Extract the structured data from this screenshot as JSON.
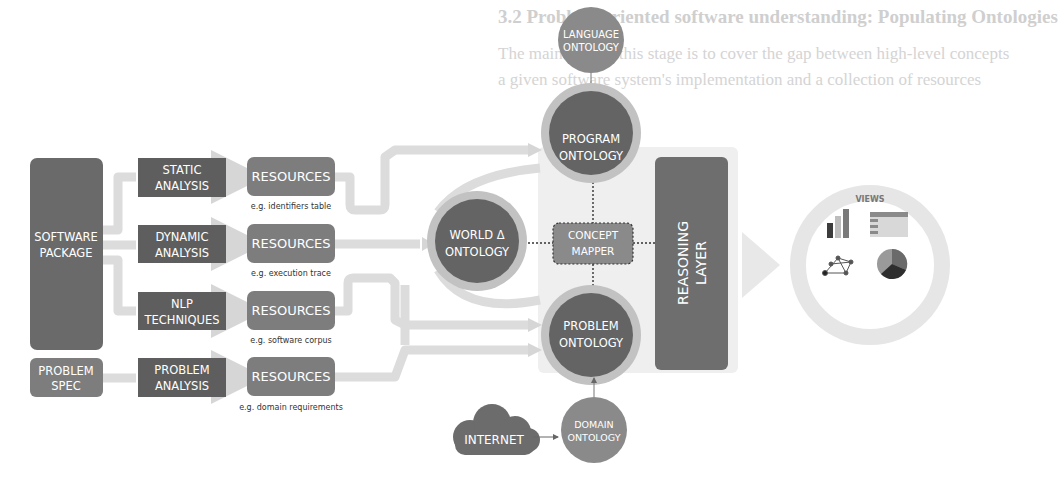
{
  "page": {
    "heading": "3.2  Problem-oriented software understanding: Populating Ontologies",
    "paragraph_lines": [
      "The main goal of this stage is to cover the gap between high-level concepts",
      "a given software system's implementation and a collection of resources",
      "and the output is ...",
      "...",
      "... important ...",
      "... a RDF-based triple store"
    ]
  },
  "diagram": {
    "sources": {
      "software_package": "SOFTWARE PACKAGE",
      "problem_spec": "PROBLEM SPEC"
    },
    "analyses": [
      {
        "label": "STATIC ANALYSIS",
        "line1": "STATIC",
        "line2": "ANALYSIS"
      },
      {
        "label": "DYNAMIC ANALYSIS",
        "line1": "DYNAMIC",
        "line2": "ANALYSIS"
      },
      {
        "label": "NLP TECHNIQUES",
        "line1": "NLP",
        "line2": "TECHNIQUES"
      },
      {
        "label": "PROBLEM ANALYSIS",
        "line1": "PROBLEM",
        "line2": "ANALYSIS"
      }
    ],
    "resources": [
      {
        "label": "RESOURCES",
        "caption": "e.g. identifiers table"
      },
      {
        "label": "RESOURCES",
        "caption": "e.g. execution trace"
      },
      {
        "label": "RESOURCES",
        "caption": "e.g. software corpus"
      },
      {
        "label": "RESOURCES",
        "caption": "e.g. domain requirements"
      }
    ],
    "ontologies": {
      "language": {
        "line1": "LANGUAGE",
        "line2": "ONTOLOGY"
      },
      "program": {
        "line1": "PROGRAM",
        "line2": "ONTOLOGY"
      },
      "world": {
        "line1": "WORLD Δ",
        "line2": "ONTOLOGY"
      },
      "problem": {
        "line1": "PROBLEM",
        "line2": "ONTOLOGY"
      },
      "domain": {
        "line1": "DOMAIN",
        "line2": "ONTOLOGY"
      }
    },
    "concept_mapper": {
      "line1": "CONCEPT",
      "line2": "MAPPER"
    },
    "reasoning_layer": {
      "line1": "REASONING",
      "line2": "LAYER"
    },
    "internet": "INTERNET",
    "views": {
      "title": "VIEWS",
      "icons": [
        "bar-chart-icon",
        "table-icon",
        "network-graph-icon",
        "pie-chart-icon"
      ]
    },
    "colors": {
      "dark_box": "#5e5e5e",
      "medium_box": "#7d7d7d",
      "circle_dark": "#666666",
      "circle_ring": "#bdbdbd",
      "arrow": "#dcdcdc",
      "reasoning_backdrop": "#ededed"
    }
  }
}
